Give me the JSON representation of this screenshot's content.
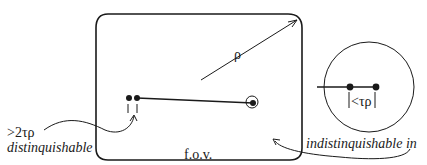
{
  "diagram": {
    "labels": {
      "rho": "ρ",
      "tau_rho_lt": "<τρ",
      "gt_2tau_rho": ">2τρ",
      "distinguishable": "distinquishable",
      "indistinguishable": "indistinquishable in",
      "fov": "f.o.v."
    },
    "colors": {
      "stroke": "#1a1a1a",
      "background": "#ffffff"
    }
  }
}
